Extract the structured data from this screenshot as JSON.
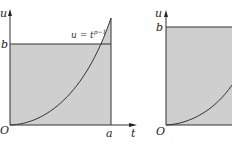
{
  "figure": {
    "colors": {
      "fill": "#cfcfcf",
      "line": "#333333",
      "background": "#ffffff"
    },
    "left_panel": {
      "axis_y_label": "u",
      "axis_x_label": "t",
      "origin_label": "O",
      "b_label": "b",
      "a_label": "a",
      "curve_label_base": "u = t",
      "curve_label_exp": "p−1"
    },
    "right_panel": {
      "axis_y_label": "u",
      "origin_label": "O",
      "b_label": "b"
    }
  }
}
